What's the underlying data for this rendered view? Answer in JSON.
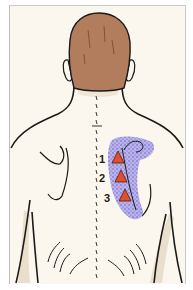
{
  "figure": {
    "colors": {
      "background": "#fbf7ee",
      "frame_border": "#c4c4c4",
      "skin": "#fbf7ee",
      "skin_shadow": "#eadfcc",
      "hair": "#b27d5c",
      "outline": "#1a1a1a",
      "pain_area": "#9a8fe0",
      "pain_stipple": "#5a4fc0",
      "trigger_point": "#e0502a"
    },
    "trigger_points": [
      {
        "label": "1",
        "x": 118,
        "y": 158
      },
      {
        "label": "2",
        "x": 121,
        "y": 177
      },
      {
        "label": "3",
        "x": 125,
        "y": 196
      }
    ],
    "labels": [
      {
        "text": "1",
        "x": 101,
        "y": 156
      },
      {
        "text": "2",
        "x": 101,
        "y": 175
      },
      {
        "text": "3",
        "x": 105,
        "y": 195
      }
    ]
  }
}
